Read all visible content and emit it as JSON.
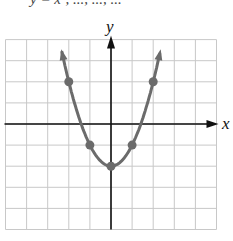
{
  "header": {
    "clipped_text": "y = x², ..., ..., ..."
  },
  "axes": {
    "x_label": "x",
    "y_label": "y"
  },
  "colors": {
    "curve": "#6b6b6b",
    "point": "#6b6b6b",
    "axis": "#111111",
    "grid": "#c8c8c8"
  },
  "chart_data": {
    "type": "line",
    "title": "",
    "function": "y = x^2 - 2",
    "xlabel": "x",
    "ylabel": "y",
    "xlim": [
      -5,
      5
    ],
    "ylim": [
      -5,
      4
    ],
    "grid": true,
    "grid_step": 1,
    "points": [
      {
        "x": -2,
        "y": 2
      },
      {
        "x": -1,
        "y": -1
      },
      {
        "x": 0,
        "y": -2
      },
      {
        "x": 1,
        "y": -1
      },
      {
        "x": 2,
        "y": 2
      }
    ],
    "curve_arrows": "both ends"
  }
}
